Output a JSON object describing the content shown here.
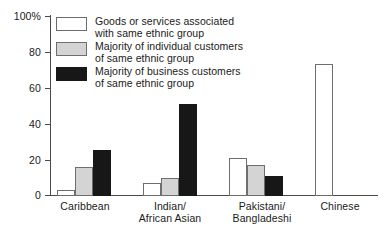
{
  "chart_data": {
    "type": "bar",
    "title": "",
    "subtitle": "",
    "xlabel": "",
    "ylabel": "",
    "grid": false,
    "legend_position": "top-left-inside",
    "categories": [
      "Caribbean",
      "Indian/\nAfrican Asian",
      "Pakistani/\nBangladeshi",
      "Chinese"
    ],
    "ylim": [
      0,
      100
    ],
    "yticks": [
      0,
      20,
      40,
      60,
      80,
      100
    ],
    "ytick_labels": [
      "0",
      "20",
      "40",
      "60",
      "80",
      "100%"
    ],
    "series": [
      {
        "name": "Goods or services associated\nwith same ethnic group",
        "color": "#ffffff",
        "values": [
          3,
          7,
          21,
          73
        ]
      },
      {
        "name": "Majority of individual customers\nof same ethnic group",
        "color": "#d4d4d4",
        "values": [
          16,
          10,
          17,
          null
        ]
      },
      {
        "name": "Majority of business customers\nof same ethnic group",
        "color": "#171717",
        "values": [
          25.5,
          51,
          11,
          null
        ]
      }
    ]
  },
  "axis": {
    "y_labels": [
      "100%",
      "80",
      "60",
      "40",
      "20",
      "0"
    ]
  },
  "legend": {
    "items": [
      {
        "swatch": "white",
        "label": "Goods or services associated\nwith same ethnic group"
      },
      {
        "swatch": "grey",
        "label": "Majority of individual customers\nof same ethnic group"
      },
      {
        "swatch": "black",
        "label": "Majority of business customers\nof same ethnic group"
      }
    ]
  },
  "categories": {
    "labels": [
      "Caribbean",
      "Indian/\nAfrican Asian",
      "Pakistani/\nBangladeshi",
      "Chinese"
    ]
  }
}
